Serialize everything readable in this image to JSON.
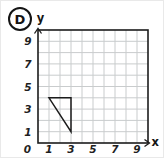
{
  "option": {
    "label": "D"
  },
  "figure": {
    "type": "coordinate-grid-with-triangle",
    "x_axis_label": "x",
    "y_axis_label": "y",
    "axis_range": [
      0,
      10
    ],
    "x_ticks": [
      {
        "value": 0,
        "label": "0"
      },
      {
        "value": 1,
        "label": "1"
      },
      {
        "value": 3,
        "label": "3"
      },
      {
        "value": 5,
        "label": "5"
      },
      {
        "value": 7,
        "label": "7"
      },
      {
        "value": 9,
        "label": "9"
      }
    ],
    "y_ticks": [
      {
        "value": 1,
        "label": "1"
      },
      {
        "value": 3,
        "label": "3"
      },
      {
        "value": 5,
        "label": "5"
      },
      {
        "value": 7,
        "label": "7"
      },
      {
        "value": 9,
        "label": "9"
      }
    ],
    "triangle_vertices": [
      [
        1,
        4
      ],
      [
        3,
        4
      ],
      [
        3,
        1
      ]
    ],
    "colors": {
      "grid_line": "#c9cccd",
      "axis": "#1c1c1c",
      "shape_stroke": "#1c1c1c",
      "background": "#ffffff",
      "text": "#1f1f1f"
    }
  }
}
